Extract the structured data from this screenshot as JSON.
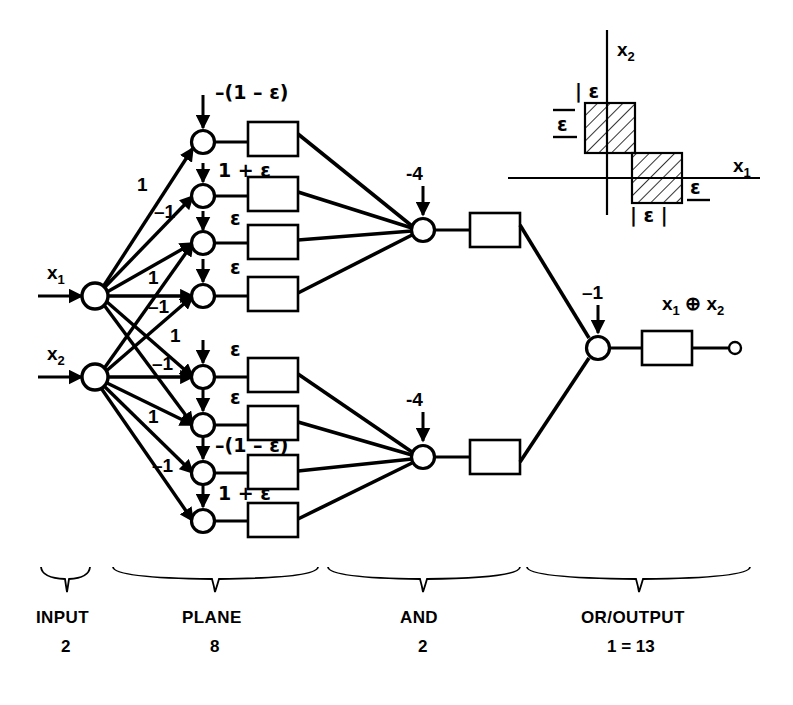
{
  "figure": {
    "type": "neural-network-diagram",
    "function": "x1 XOR x2",
    "total_units_label": "1 = 13"
  },
  "inputs": [
    {
      "id": "x1",
      "label": "x",
      "sub": "1"
    },
    {
      "id": "x2",
      "label": "x",
      "sub": "2"
    }
  ],
  "weights": {
    "pos": "1",
    "neg": "–1",
    "list": [
      "1",
      "–1",
      "1",
      "–1",
      "1",
      "–1",
      "1",
      "–1"
    ]
  },
  "plane_layer": {
    "count": 8,
    "biases": [
      "–(1 – ε)",
      "1 + ε",
      "ε",
      "ε",
      "ε",
      "ε",
      "–(1 – ε)",
      "1 + ε"
    ]
  },
  "and_layer": {
    "count": 2,
    "biases": [
      "-4",
      "-4"
    ]
  },
  "or_layer": {
    "count": 1,
    "bias": "–1"
  },
  "output": {
    "label_x1": "x",
    "label_x1_sub": "1",
    "operator": "⊕",
    "label_x2": "x",
    "label_x2_sub": "2"
  },
  "inset": {
    "x_axis_label": "x",
    "x_axis_sub": "1",
    "y_axis_label": "x",
    "y_axis_sub": "2",
    "labels": {
      "top_box_top": "| ε",
      "top_box_left": "ε",
      "bottom_box_right": "ε",
      "bottom_box_bottom": "| ε |"
    }
  },
  "groups": [
    {
      "name": "INPUT",
      "count": "2"
    },
    {
      "name": "PLANE",
      "count": "8"
    },
    {
      "name": "AND",
      "count": "2"
    },
    {
      "name": "OR/OUTPUT",
      "count": "1 = 13"
    }
  ],
  "colors": {
    "ink": "#000000",
    "paper": "#ffffff"
  }
}
